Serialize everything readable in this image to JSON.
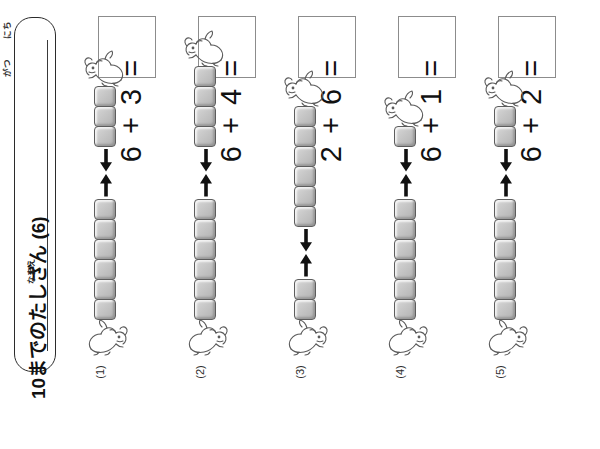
{
  "worksheet": {
    "title": "10までのたしざん (6)",
    "name_label": "なまえ",
    "date_day_label": "にち",
    "date_month_label": "がつ"
  },
  "problems": [
    {
      "number": "(1)",
      "equation": "6 + 3 =",
      "addend_bottom": 6,
      "addend_top": 3,
      "answer": "",
      "bottom_cubes": 6,
      "top_cubes": 3
    },
    {
      "number": "(2)",
      "equation": "6 + 4 =",
      "addend_bottom": 6,
      "addend_top": 4,
      "answer": "",
      "bottom_cubes": 6,
      "top_cubes": 4
    },
    {
      "number": "(3)",
      "equation": "2 + 6 =",
      "addend_bottom": 2,
      "addend_top": 6,
      "answer": "",
      "bottom_cubes": 2,
      "top_cubes": 6
    },
    {
      "number": "(4)",
      "equation": "6 + 1 =",
      "addend_bottom": 6,
      "addend_top": 1,
      "answer": "",
      "bottom_cubes": 6,
      "top_cubes": 1
    },
    {
      "number": "(5)",
      "equation": "6 + 2 =",
      "addend_bottom": 6,
      "addend_top": 2,
      "answer": "",
      "bottom_cubes": 6,
      "top_cubes": 2
    }
  ],
  "icons": {
    "cube": "cube-block-icon",
    "arrow_down": "arrow-down-icon",
    "arrow_up": "arrow-up-icon",
    "animal": "cartoon-dog-icon"
  },
  "colors": {
    "page_background": "#ffffff",
    "ink": "#1a1a1a",
    "cube_fill": "#c6c6c6",
    "cube_stroke": "#5d5d5d",
    "box_stroke": "#8c8c8c",
    "plate_stroke": "#2b2b2b"
  }
}
